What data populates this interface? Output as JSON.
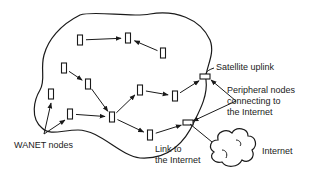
{
  "diagram": {
    "labels": {
      "wanet_nodes": "WANET nodes",
      "satellite_uplink": "Satellite uplink",
      "peripheral_line1": "Peripheral nodes",
      "peripheral_line2": "connecting to",
      "peripheral_line3": "the Internet",
      "link_line1": "Link to",
      "link_line2": "the Internet",
      "internet": "Internet"
    },
    "nodes": [
      {
        "id": "A",
        "type": "wanet-node"
      },
      {
        "id": "B",
        "type": "wanet-node"
      },
      {
        "id": "C",
        "type": "wanet-node"
      },
      {
        "id": "D",
        "type": "wanet-node"
      },
      {
        "id": "E",
        "type": "wanet-node"
      },
      {
        "id": "F",
        "type": "wanet-node"
      },
      {
        "id": "G",
        "type": "wanet-node"
      },
      {
        "id": "H",
        "type": "wanet-node"
      },
      {
        "id": "I",
        "type": "wanet-node"
      },
      {
        "id": "J",
        "type": "wanet-node"
      },
      {
        "id": "K",
        "type": "wanet-node"
      },
      {
        "id": "S",
        "type": "peripheral-node",
        "role": "Satellite uplink"
      },
      {
        "id": "L",
        "type": "peripheral-node",
        "role": "Link to the Internet"
      }
    ],
    "edges": [
      {
        "from": "A",
        "to": "B"
      },
      {
        "from": "C",
        "to": "B"
      },
      {
        "from": "D",
        "to": "E"
      },
      {
        "from": "E",
        "to": "H"
      },
      {
        "from": "G",
        "to": "H"
      },
      {
        "from": "H",
        "to": "I"
      },
      {
        "from": "H",
        "to": "K"
      },
      {
        "from": "I",
        "to": "J"
      },
      {
        "from": "J",
        "to": "S"
      },
      {
        "from": "K",
        "to": "L"
      }
    ]
  }
}
